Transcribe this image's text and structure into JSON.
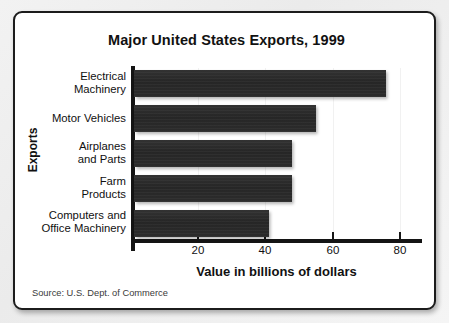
{
  "figure": {
    "title": "Major United States Exports, 1999",
    "source_note": "Source: U.S. Dept. of Commerce",
    "y_axis_title": "Exports",
    "x_axis_title": "Value in billions of dollars"
  },
  "chart_data": {
    "type": "bar",
    "orientation": "horizontal",
    "title": "Major United States Exports, 1999",
    "xlabel": "Value in billions of dollars",
    "ylabel": "Exports",
    "categories": [
      "Electrical Machinery",
      "Motor Vehicles",
      "Airplanes and Parts",
      "Farm Products",
      "Computers and Office Machinery"
    ],
    "category_lines": [
      [
        "Electrical",
        "Machinery"
      ],
      [
        "Motor Vehicles"
      ],
      [
        "Airplanes",
        "and Parts"
      ],
      [
        "Farm",
        "Products"
      ],
      [
        "Computers and",
        "Office Machinery"
      ]
    ],
    "values": [
      75,
      54,
      47,
      47,
      40
    ],
    "units": "billions of dollars",
    "xlim": [
      0,
      86
    ],
    "xticks": [
      20,
      40,
      60,
      80
    ],
    "xtick_labels": [
      "20",
      "40",
      "60",
      "80"
    ],
    "grid": "faint-vertical",
    "legend": "none",
    "bar_color": "#2a2a2a",
    "background_color": "#ffffff",
    "border_color": "#1c1c1c"
  }
}
